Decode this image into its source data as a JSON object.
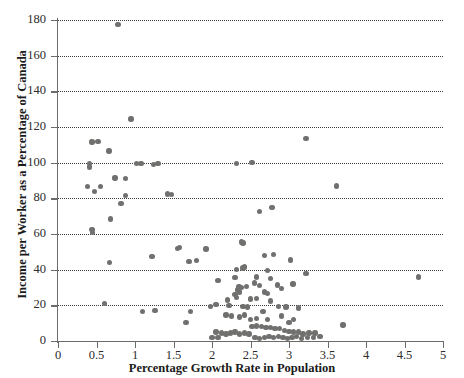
{
  "chart_data": {
    "type": "scatter",
    "title": "",
    "xlabel": "Percentage Growth Rate in Population",
    "ylabel": "Income per Worker as a Percentage of Canada",
    "xlim": [
      0,
      5
    ],
    "ylim": [
      0,
      180
    ],
    "xticks": [
      0,
      0.5,
      1,
      1.5,
      2,
      2.5,
      3,
      3.5,
      4,
      4.5,
      5
    ],
    "xticklabels": [
      "0",
      "0.5",
      "1",
      "1.5",
      "2",
      "2.5",
      "3",
      "3.5",
      "4",
      "4.5",
      "5"
    ],
    "yticks": [
      0,
      20,
      40,
      60,
      80,
      100,
      120,
      140,
      160,
      180
    ],
    "yticklabels": [
      "0",
      "20",
      "40",
      "60",
      "80",
      "100",
      "120",
      "140",
      "160",
      "180"
    ],
    "grid": "horizontal-dotted",
    "legend": null,
    "marker_color": "#70706f",
    "axis_color": "#6b6b6b",
    "points": [
      [
        0.78,
        177.5
      ],
      [
        0.95,
        124.5
      ],
      [
        3.22,
        113.5
      ],
      [
        0.44,
        111.5
      ],
      [
        0.52,
        112.0
      ],
      [
        0.66,
        106.5
      ],
      [
        0.41,
        99.5
      ],
      [
        0.41,
        97.5
      ],
      [
        1.02,
        99.5
      ],
      [
        1.08,
        99.5
      ],
      [
        1.24,
        99.0
      ],
      [
        1.3,
        99.5
      ],
      [
        2.32,
        99.5
      ],
      [
        2.52,
        100.0
      ],
      [
        0.88,
        91.0
      ],
      [
        3.62,
        87.0
      ],
      [
        0.38,
        86.5
      ],
      [
        0.55,
        86.5
      ],
      [
        0.47,
        84.0
      ],
      [
        0.74,
        91.5
      ],
      [
        0.88,
        81.5
      ],
      [
        1.42,
        82.5
      ],
      [
        1.47,
        82.0
      ],
      [
        0.82,
        77.0
      ],
      [
        2.78,
        75.0
      ],
      [
        2.62,
        72.5
      ],
      [
        0.68,
        68.5
      ],
      [
        0.44,
        62.5
      ],
      [
        0.45,
        61.0
      ],
      [
        2.38,
        55.5
      ],
      [
        2.4,
        55.0
      ],
      [
        1.92,
        51.5
      ],
      [
        2.68,
        48.0
      ],
      [
        2.8,
        48.5
      ],
      [
        1.22,
        47.5
      ],
      [
        1.55,
        52.0
      ],
      [
        1.58,
        52.5
      ],
      [
        0.67,
        44.0
      ],
      [
        1.7,
        44.5
      ],
      [
        1.8,
        45.0
      ],
      [
        3.02,
        45.5
      ],
      [
        2.4,
        41.0
      ],
      [
        2.42,
        41.5
      ],
      [
        3.22,
        38.0
      ],
      [
        4.68,
        36.0
      ],
      [
        2.32,
        40.0
      ],
      [
        2.72,
        39.5
      ],
      [
        2.08,
        34.0
      ],
      [
        2.35,
        30.5
      ],
      [
        2.38,
        30.0
      ],
      [
        2.33,
        28.5
      ],
      [
        2.36,
        27.5
      ],
      [
        2.45,
        30.5
      ],
      [
        2.55,
        32.5
      ],
      [
        2.62,
        31.0
      ],
      [
        2.85,
        31.5
      ],
      [
        2.9,
        29.5
      ],
      [
        3.05,
        32.0
      ],
      [
        2.68,
        27.5
      ],
      [
        2.72,
        26.5
      ],
      [
        2.3,
        26.0
      ],
      [
        2.32,
        24.5
      ],
      [
        2.2,
        23.0
      ],
      [
        2.58,
        24.0
      ],
      [
        2.76,
        22.5
      ],
      [
        0.6,
        21.0
      ],
      [
        1.98,
        19.5
      ],
      [
        2.05,
        20.5
      ],
      [
        2.22,
        20.0
      ],
      [
        2.4,
        19.5
      ],
      [
        2.46,
        19.0
      ],
      [
        2.86,
        19.5
      ],
      [
        2.96,
        19.0
      ],
      [
        3.12,
        18.5
      ],
      [
        1.1,
        16.5
      ],
      [
        1.26,
        17.0
      ],
      [
        1.72,
        16.5
      ],
      [
        2.18,
        14.5
      ],
      [
        2.25,
        14.0
      ],
      [
        2.36,
        13.5
      ],
      [
        2.42,
        14.5
      ],
      [
        2.58,
        12.5
      ],
      [
        2.72,
        12.0
      ],
      [
        1.66,
        10.5
      ],
      [
        2.05,
        5.0
      ],
      [
        2.12,
        4.5
      ],
      [
        2.18,
        4.0
      ],
      [
        2.24,
        4.5
      ],
      [
        2.3,
        5.0
      ],
      [
        2.36,
        4.0
      ],
      [
        2.42,
        4.5
      ],
      [
        2.48,
        4.0
      ],
      [
        2.0,
        2.0
      ],
      [
        2.08,
        2.0
      ],
      [
        2.52,
        8.0
      ],
      [
        2.58,
        8.5
      ],
      [
        2.64,
        8.0
      ],
      [
        2.7,
        7.5
      ],
      [
        2.76,
        7.5
      ],
      [
        2.82,
        7.0
      ],
      [
        2.88,
        7.0
      ],
      [
        2.94,
        6.0
      ],
      [
        3.0,
        5.5
      ],
      [
        3.06,
        5.0
      ],
      [
        3.12,
        5.0
      ],
      [
        2.56,
        2.0
      ],
      [
        2.62,
        1.5
      ],
      [
        2.68,
        2.0
      ],
      [
        2.74,
        2.5
      ],
      [
        2.8,
        2.0
      ],
      [
        2.86,
        2.5
      ],
      [
        2.92,
        2.0
      ],
      [
        2.98,
        1.5
      ],
      [
        3.04,
        2.0
      ],
      [
        3.1,
        2.5
      ],
      [
        3.18,
        4.0
      ],
      [
        3.26,
        4.5
      ],
      [
        3.34,
        4.5
      ],
      [
        3.7,
        9.0
      ],
      [
        3.16,
        1.5
      ],
      [
        3.24,
        2.0
      ],
      [
        3.32,
        2.0
      ],
      [
        3.4,
        2.5
      ],
      [
        2.5,
        12.0
      ],
      [
        2.3,
        35.5
      ],
      [
        2.58,
        36.0
      ],
      [
        2.76,
        35.0
      ],
      [
        2.5,
        23.5
      ],
      [
        2.66,
        16.5
      ],
      [
        2.9,
        14.0
      ],
      [
        3.0,
        10.5
      ],
      [
        3.06,
        12.0
      ]
    ]
  }
}
